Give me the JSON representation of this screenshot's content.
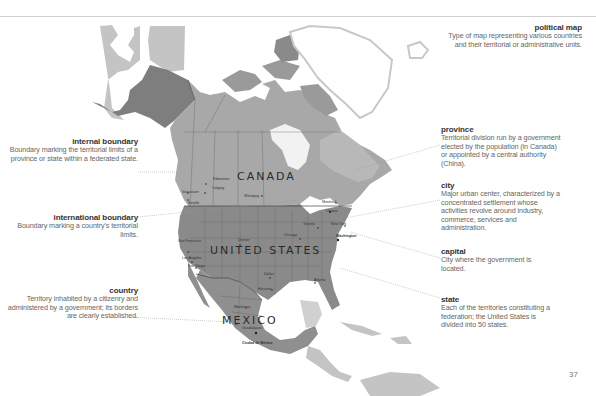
{
  "colors": {
    "usa": "#8a8a8a",
    "canada": "#a8a8a8",
    "mexico": "#8f8f8f",
    "greenland": "#ffffff",
    "greenland_outline": "#c8c8c8",
    "other_land": "#c4c4c4",
    "alaska": "#7e7e7e",
    "boundary": "#555555",
    "leader": "#999999"
  },
  "callouts": {
    "political_map": {
      "title": "political map",
      "text": "Type of map representing various countries and their territorial or administrative units."
    },
    "internal_boundary": {
      "title": "internal boundary",
      "text": "Boundary marking the territorial limits of a province or state within a federated state."
    },
    "international_boundary": {
      "title": "international boundary",
      "text": "Boundary marking a country's territorial limits."
    },
    "country": {
      "title": "country",
      "text": "Territory inhabited by a citizenry and administered by a government; its borders are clearly established."
    },
    "province": {
      "title": "province",
      "text": "Territorial division run by a government elected by the population (in Canada) or appointed by a central authority (China)."
    },
    "city": {
      "title": "city",
      "text": "Major urban center, characterized by a concentrated settlement whose activities revolve around industry, commerce, services and administration."
    },
    "capital": {
      "title": "capital",
      "text": "City where the government is located."
    },
    "state": {
      "title": "state",
      "text": "Each of the territories constituting a federation; the United States is divided into 50 states."
    }
  },
  "countries": {
    "canada": "CANADA",
    "usa": "UNITED STATES",
    "mexico": "MEXICO"
  },
  "cities": {
    "edmonton": "Edmonton",
    "calgary": "Calgary",
    "vancouver": "Vancouver",
    "seattle": "Seattle",
    "winnipeg": "Winnipeg",
    "montreal": "Montréal",
    "ottawa": "Ottawa",
    "toronto": "Toronto",
    "new_york": "New York",
    "washington": "Washington",
    "chicago": "Chicago",
    "denver": "Denver",
    "san_francisco": "San Francisco",
    "los_angeles": "Los Angeles",
    "san_diego": "San Diego",
    "dallas": "Dallas",
    "houston": "Houston",
    "atlanta": "Atlanta",
    "monterrey": "Monterrey",
    "guadalajara": "Guadalajara",
    "mexico_city": "Ciudad de México"
  },
  "page_number": "37"
}
